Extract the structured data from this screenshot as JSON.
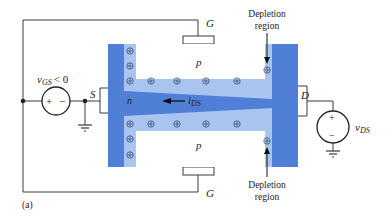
{
  "figure": {
    "label": "(a)",
    "colors": {
      "n_region": "#4f7fd6",
      "depletion_region": "#a9c4ee",
      "p_region": "#ffffff",
      "wire": "#3a3a3a"
    }
  },
  "terminals": {
    "gate_top": "G",
    "gate_bottom": "G",
    "source": "S",
    "drain": "D"
  },
  "regions": {
    "p_top": "p",
    "p_bottom": "p",
    "n_channel": "n"
  },
  "sources": {
    "vgs": {
      "label": "v",
      "subscript": "GS",
      "condition": "< 0",
      "plus": "+",
      "minus": "−"
    },
    "vds": {
      "label": "v",
      "subscript": "DS",
      "plus": "+",
      "minus": "−"
    }
  },
  "current": {
    "label": "i",
    "subscript": "DS"
  },
  "annotations": {
    "depletion_top_line1": "Depletion",
    "depletion_top_line2": "region",
    "depletion_bottom_line1": "Depletion",
    "depletion_bottom_line2": "region"
  },
  "ions": {
    "symbol": "⊕"
  }
}
